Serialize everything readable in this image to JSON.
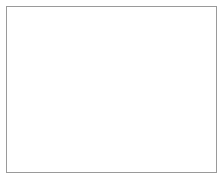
{
  "figure": {
    "title": "",
    "background_color": "#ffffff",
    "frame_color": "#9a9a9a",
    "frame": {
      "x": 6,
      "y": 6,
      "width": 211,
      "height": 167
    }
  },
  "chart_data": {
    "type": "scatter",
    "title": "",
    "subtitle": "",
    "xlabel": "",
    "ylabel": "",
    "zlabel": "",
    "grid": false,
    "legend": null,
    "axes_visible": false,
    "tick_labels": [],
    "annotations": [],
    "projection": "3d-isometric",
    "style": {
      "point_color": "#7a7a86",
      "ridge_color": "#8f8f98",
      "spike_color": "#3a3a42",
      "post_color": "#8a8a94",
      "point_count": 520,
      "point_radius": [
        0.4,
        1.3
      ]
    },
    "xlim": [
      0,
      1
    ],
    "ylim": [
      0,
      1
    ],
    "zlim": [
      0,
      1
    ],
    "features": [
      {
        "name": "main-beam-ridge",
        "kind": "ridge",
        "from": [
          62,
          121
        ],
        "to": [
          176,
          92
        ],
        "value": 0.0
      },
      {
        "name": "cross-beam-ridge",
        "kind": "ridge",
        "from": [
          38,
          98
        ],
        "to": [
          108,
          148
        ],
        "value": 0.0
      },
      {
        "name": "center-downward-spike",
        "kind": "spike",
        "x": 78,
        "y_top": 120,
        "y_bottom": 163,
        "height": -1.0,
        "color": "#33333b"
      }
    ],
    "posts": [
      {
        "name": "post-1",
        "x": 84,
        "y_base": 114,
        "y_top": 62,
        "height": 0.86
      },
      {
        "name": "post-2",
        "x": 124,
        "y_base": 104,
        "y_top": 63,
        "height": 0.7
      },
      {
        "name": "post-3",
        "x": 161,
        "y_base": 96,
        "y_top": 58,
        "height": 0.65
      }
    ],
    "series": [
      {
        "name": "ridge-surface",
        "values": [
          0.0,
          0.0,
          0.0,
          0.0
        ]
      },
      {
        "name": "posts",
        "categories": [
          "post-1",
          "post-2",
          "post-3"
        ],
        "values": [
          0.86,
          0.7,
          0.65
        ]
      },
      {
        "name": "downward-spike",
        "categories": [
          "center"
        ],
        "values": [
          -1.0
        ]
      }
    ]
  }
}
